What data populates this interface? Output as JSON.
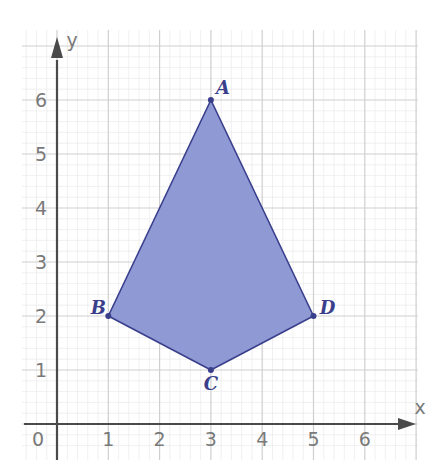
{
  "part_marker": ")",
  "chart_data": {
    "type": "polygon",
    "title": "",
    "xlabel": "x",
    "ylabel": "y",
    "xlim": [
      -0.7,
      7.5
    ],
    "ylim": [
      -0.5,
      7.1
    ],
    "origin_label": "0",
    "x_ticks": [
      1,
      2,
      3,
      4,
      5,
      6
    ],
    "y_ticks": [
      1,
      2,
      3,
      4,
      5,
      6
    ],
    "grid": true,
    "minor_grid_per_unit": 5,
    "shape": {
      "name": "kite ABCD",
      "fill": "#8f99d4",
      "stroke": "#3a3f8c",
      "vertices": [
        {
          "label": "A",
          "x": 3,
          "y": 6,
          "label_pos": "top-right"
        },
        {
          "label": "D",
          "x": 5,
          "y": 2,
          "label_pos": "right"
        },
        {
          "label": "C",
          "x": 3,
          "y": 1,
          "label_pos": "bottom"
        },
        {
          "label": "B",
          "x": 1,
          "y": 2,
          "label_pos": "left"
        }
      ]
    },
    "colors": {
      "axis": "#4a4a4a",
      "major_grid": "#cfcfcf",
      "minor_grid": "#ececec",
      "tick_text": "#7a7a7a"
    }
  }
}
